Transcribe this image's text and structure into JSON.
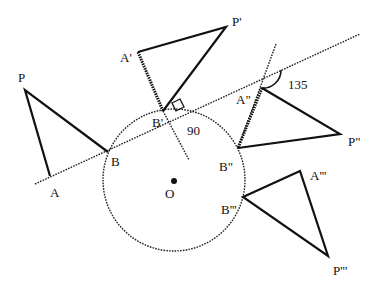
{
  "diagram": {
    "title": "",
    "points": {
      "P": {
        "label": "P",
        "x": 25,
        "y": 90
      },
      "A": {
        "label": "A",
        "x": 50,
        "y": 176
      },
      "B": {
        "label": "B",
        "x": 108,
        "y": 152
      },
      "P1": {
        "label": "P'",
        "x": 226,
        "y": 27
      },
      "A1": {
        "label": "A'",
        "x": 138,
        "y": 52
      },
      "B1": {
        "label": "B'",
        "x": 163,
        "y": 111
      },
      "P2": {
        "label": "P\"",
        "x": 340,
        "y": 134
      },
      "A2": {
        "label": "A\"",
        "x": 262,
        "y": 88
      },
      "B2": {
        "label": "B\"",
        "x": 238,
        "y": 148
      },
      "P3": {
        "label": "P'''",
        "x": 328,
        "y": 256
      },
      "A3": {
        "label": "A'''",
        "x": 300,
        "y": 171
      },
      "B3": {
        "label": "B'''",
        "x": 243,
        "y": 197
      },
      "O": {
        "label": "O",
        "x": 174,
        "y": 181
      }
    },
    "angles": {
      "right_angle": "90",
      "obtuse_angle": "135"
    },
    "circle": {
      "cx": 174,
      "cy": 180,
      "r": 71
    },
    "colors": {
      "ink": "#111111",
      "background": "#ffffff"
    }
  }
}
